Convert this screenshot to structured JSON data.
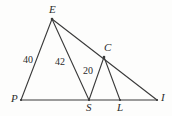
{
  "figure": {
    "kind": "geometry-diagram",
    "background_color": "#fdfdfc",
    "stroke_color": "#3a3a3a",
    "text_color": "#2b2b2b"
  },
  "points": {
    "E": {
      "label": "E",
      "x": 52,
      "y": 19,
      "label_x": 49,
      "label_y": 4
    },
    "P": {
      "label": "P",
      "x": 21,
      "y": 100,
      "label_x": 11,
      "label_y": 93
    },
    "S": {
      "label": "S",
      "x": 89,
      "y": 100,
      "label_x": 86,
      "label_y": 102
    },
    "L": {
      "label": "L",
      "x": 120,
      "y": 100,
      "label_x": 117,
      "label_y": 102
    },
    "I": {
      "label": "I",
      "x": 157,
      "y": 100,
      "label_x": 161,
      "label_y": 92
    },
    "C": {
      "label": "C",
      "x": 104,
      "y": 57,
      "label_x": 104,
      "label_y": 42
    }
  },
  "segments": [
    {
      "name": "P-I-baseline",
      "from": "P",
      "to": "I"
    },
    {
      "name": "E-P",
      "from": "E",
      "to": "P"
    },
    {
      "name": "E-S",
      "from": "E",
      "to": "S"
    },
    {
      "name": "E-I",
      "from": "E",
      "to": "I"
    },
    {
      "name": "S-C",
      "from": "S",
      "to": "C"
    },
    {
      "name": "C-L",
      "from": "C",
      "to": "L"
    }
  ],
  "measures": [
    {
      "name": "EP-length",
      "value": "40",
      "x": 23,
      "y": 55
    },
    {
      "name": "ES-length",
      "value": "42",
      "x": 55,
      "y": 57
    },
    {
      "name": "SC-length",
      "value": "20",
      "x": 83,
      "y": 66
    }
  ]
}
